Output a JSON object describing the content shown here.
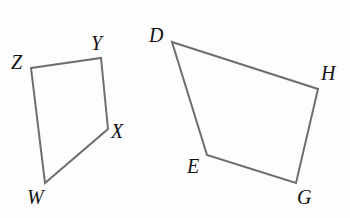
{
  "figure": {
    "background_color": "#fdfdfd",
    "stroke_color": "#6e6e6e",
    "label_color": "#111111",
    "stroke_width": 2,
    "canvas": {
      "width": 350,
      "height": 218
    }
  },
  "shapes": [
    {
      "name": "quadrilateral-wxyz",
      "label": "WXYZ",
      "vertex_order": [
        "Z",
        "Y",
        "X",
        "W"
      ],
      "points": "31,68 101,58 108,129 45,183",
      "vertices": [
        {
          "id": "Z",
          "label": "Z",
          "x": 31,
          "y": 68
        },
        {
          "id": "Y",
          "label": "Y",
          "x": 101,
          "y": 58
        },
        {
          "id": "X",
          "label": "X",
          "x": 108,
          "y": 129
        },
        {
          "id": "W",
          "label": "W",
          "x": 45,
          "y": 183
        }
      ]
    },
    {
      "name": "quadrilateral-degh",
      "label": "DEGH",
      "vertex_order": [
        "D",
        "H",
        "G",
        "E"
      ],
      "points": "172,42 318,89 296,183 207,155",
      "vertices": [
        {
          "id": "D",
          "label": "D",
          "x": 172,
          "y": 42
        },
        {
          "id": "H",
          "label": "H",
          "x": 318,
          "y": 89
        },
        {
          "id": "G",
          "label": "G",
          "x": 296,
          "y": 183
        },
        {
          "id": "E",
          "label": "E",
          "x": 207,
          "y": 155
        }
      ]
    }
  ],
  "labels": {
    "Z": "Z",
    "Y": "Y",
    "X": "X",
    "W": "W",
    "D": "D",
    "H": "H",
    "G": "G",
    "E": "E"
  }
}
